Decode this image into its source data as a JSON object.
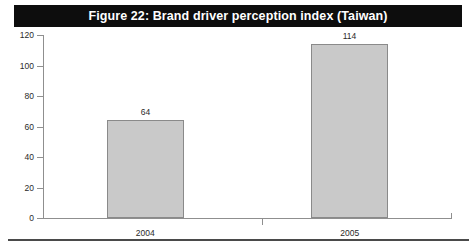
{
  "figure": {
    "title": "Figure 22: Brand driver perception index (Taiwan)"
  },
  "colors": {
    "title_bar_background": "#0d0d0d",
    "title_text": "#ffffff",
    "bar_fill": "#c9c9c9",
    "bar_border": "#8a8a8a",
    "axis_line": "#8f8f8f",
    "axis_text": "#2a2a2a",
    "page_background": "#ffffff",
    "bottom_rule": "#4a4a4a"
  },
  "chart_data": {
    "type": "bar",
    "title": "Figure 22: Brand driver perception index (Taiwan)",
    "xlabel": "",
    "ylabel": "",
    "categories": [
      "2004",
      "2005"
    ],
    "values": [
      64,
      114
    ],
    "value_labels": [
      "64",
      "114"
    ],
    "ylim": [
      0,
      120
    ],
    "yticks": [
      0,
      20,
      40,
      60,
      80,
      100,
      120
    ],
    "ytick_labels": [
      "0",
      "20",
      "40",
      "60",
      "80",
      "100",
      "120"
    ],
    "grid": false,
    "legend": false,
    "series": [
      {
        "name": "Brand driver perception index",
        "values": [
          64,
          114
        ]
      }
    ]
  }
}
